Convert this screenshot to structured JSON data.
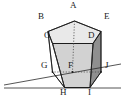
{
  "figure": {
    "name": "pentagonal-prism-with-transversal-lines",
    "type": "geometric-solid-diagram",
    "background_color": "#ffffff",
    "stroke_color": "#1a1a1a",
    "hidden_edge_style": "dotted",
    "shading": {
      "top_face_fill": "#e8e8e8",
      "front_left_face_fill": "#fbfbfb",
      "front_center_face_fill": "#d9d9d9",
      "front_right_face_fill": "#a8a8a8",
      "far_right_face_fill": "#8f8f8f",
      "bottom_face_fill": "#c4c4c4"
    }
  },
  "vertices": {
    "A": {
      "label": "A",
      "x": 74.5,
      "y": 21.0,
      "label_x": 70,
      "label_y": 1,
      "visible": true
    },
    "B": {
      "label": "B",
      "x": 48.0,
      "y": 31.5,
      "label_x": 38,
      "label_y": 12,
      "visible": true
    },
    "C": {
      "label": "C",
      "x": 52.5,
      "y": 43.5,
      "label_x": 43,
      "label_y": 28,
      "visible": true
    },
    "D": {
      "label": "D",
      "x": 93.0,
      "y": 43.5,
      "label_x": 87,
      "label_y": 28,
      "visible": true
    },
    "E": {
      "label": "E",
      "x": 101.0,
      "y": 31.5,
      "label_x": 103,
      "label_y": 12,
      "visible": true
    },
    "F": {
      "label": "F",
      "x": 72.5,
      "y": 72.0,
      "label_x": 69,
      "label_y": 60,
      "visible": true
    },
    "G": {
      "label": "G",
      "x": 52.5,
      "y": 72.0,
      "label_x": 40,
      "label_y": 57,
      "visible": true
    },
    "H": {
      "label": "H",
      "x": 64.5,
      "y": 87.5,
      "label_x": 59,
      "label_y": 80,
      "visible": true
    },
    "I": {
      "label": "I",
      "x": 90.0,
      "y": 87.5,
      "label_x": 87,
      "label_y": 80,
      "visible": true
    },
    "J": {
      "label": "J",
      "x": 101.0,
      "y": 72.0,
      "label_x": 104,
      "label_y": 57,
      "visible": true
    }
  },
  "labels_list": [
    "A",
    "B",
    "C",
    "D",
    "E",
    "F",
    "G",
    "H",
    "I",
    "J"
  ],
  "transversal_lines": [
    {
      "name": "line-through-G",
      "x1": 4,
      "y1": 85,
      "x2": 121,
      "y2": 64
    },
    {
      "name": "baseline-through-H-I",
      "x1": 4,
      "y1": 88,
      "x2": 121,
      "y2": 88
    }
  ]
}
